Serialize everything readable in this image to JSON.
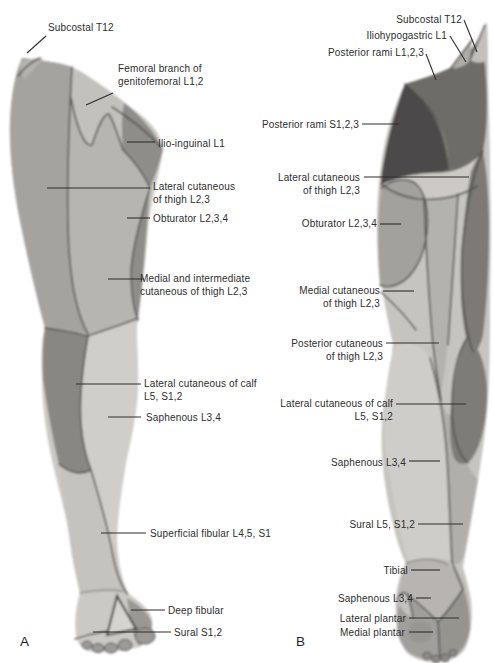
{
  "figure": {
    "panel_count": 2
  },
  "panel_a": {
    "letter": "A",
    "labels": {
      "subcostal": "Subcostal T12",
      "femoral_branch_genitofemoral": "Femoral branch of\ngenitofemoral L1,2",
      "ilio_inguinal": "Ilio-inguinal L1",
      "lateral_cutaneous_thigh": "Lateral cutaneous\nof thigh L2,3",
      "obturator": "Obturator L2,3,4",
      "medial_intermediate_cutaneous_thigh": "Medial and intermediate\ncutaneous of thigh L2,3",
      "lateral_cutaneous_calf": "Lateral cutaneous of calf\nL5, S1,2",
      "saphenous": "Saphenous L3,4",
      "superficial_fibular": "Superficial fibular L4,5, S1",
      "deep_fibular": "Deep fibular",
      "sural": "Sural S1,2"
    }
  },
  "panel_b": {
    "letter": "B",
    "labels": {
      "subcostal": "Subcostal T12",
      "iliohypogastric": "Iliohypogastric L1",
      "posterior_rami_lumbar": "Posterior rami L1,2,3",
      "posterior_rami_sacral": "Posterior rami S1,2,3",
      "lateral_cutaneous_thigh": "Lateral cutaneous\nof thigh L2,3",
      "obturator": "Obturator L2,3,4",
      "medial_cutaneous_thigh": "Medial cutaneous\nof thigh L2,3",
      "posterior_cutaneous_thigh": "Posterior cutaneous\nof thigh L2,3",
      "lateral_cutaneous_calf": "Lateral cutaneous of calf\nL5, S1,2",
      "saphenous": "Saphenous L3,4",
      "sural": "Sural L5, S1,2",
      "tibial": "Tibial",
      "saphenous_foot": "Saphenous L3,4",
      "lateral_plantar": "Lateral plantar",
      "medial_plantar": "Medial plantar"
    }
  },
  "colors": {
    "background": "#ffffff",
    "skin_base": "#cbc9c5",
    "region_light": "#d0cecb",
    "region_medium": "#a5a3a0",
    "region_dark": "#7b7976",
    "region_darkest": "#4c4a48",
    "outline": "#4f4d4a",
    "leader_line": "#2f2f2f",
    "label_text": "#2e2e2e"
  }
}
